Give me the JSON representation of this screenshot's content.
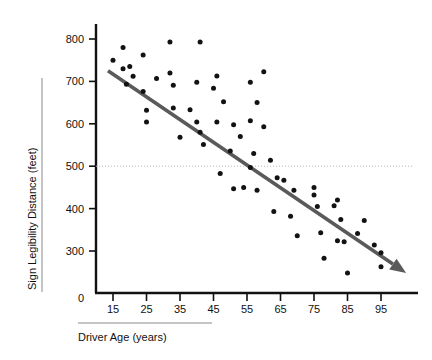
{
  "chart_data": {
    "type": "scatter",
    "title": "",
    "xlabel": "Driver Age (years)",
    "ylabel": "Sign Legibility Distance (feet)",
    "xlim": [
      10,
      102
    ],
    "ylim": [
      230,
      820
    ],
    "xticks": [
      "15",
      "25",
      "35",
      "45",
      "55",
      "65",
      "75",
      "85",
      "95"
    ],
    "xtick_values": [
      15,
      25,
      35,
      45,
      55,
      65,
      75,
      85,
      95
    ],
    "yticks": [
      "300",
      "400",
      "500",
      "600",
      "700",
      "800"
    ],
    "ytick_values": [
      300,
      400,
      500,
      600,
      700,
      800
    ],
    "origin_label": "0",
    "grid": false,
    "legend": null,
    "reference_line": {
      "name": "legibility-500-reference",
      "orientation": "horizontal",
      "y": 500,
      "style": "dotted",
      "color": "#b9b9b9"
    },
    "trend_line": {
      "name": "regression-trend-arrow",
      "type": "linear-fit",
      "color": "#5a5a5a",
      "x_start": 13.5,
      "y_start": 725,
      "x_end": 102.5,
      "y_end": 248,
      "arrow": true
    },
    "series": [
      {
        "name": "Driver sign legibility observations",
        "marker": "filled-circle",
        "color": "#121212",
        "points": [
          [
            15,
            750
          ],
          [
            18,
            780
          ],
          [
            18,
            730
          ],
          [
            19,
            693
          ],
          [
            20,
            735
          ],
          [
            21,
            712
          ],
          [
            24,
            762
          ],
          [
            24,
            676
          ],
          [
            25,
            632
          ],
          [
            25,
            604
          ],
          [
            28,
            707
          ],
          [
            32,
            793
          ],
          [
            32,
            720
          ],
          [
            33,
            691
          ],
          [
            33,
            637
          ],
          [
            35,
            568
          ],
          [
            38,
            633
          ],
          [
            40,
            698
          ],
          [
            40,
            604
          ],
          [
            41,
            793
          ],
          [
            41,
            580
          ],
          [
            42,
            551
          ],
          [
            45,
            684
          ],
          [
            46,
            713
          ],
          [
            46,
            604
          ],
          [
            47,
            483
          ],
          [
            48,
            652
          ],
          [
            50,
            536
          ],
          [
            51,
            598
          ],
          [
            51,
            447
          ],
          [
            53,
            570
          ],
          [
            54,
            450
          ],
          [
            56,
            607
          ],
          [
            56,
            698
          ],
          [
            56,
            497
          ],
          [
            57,
            530
          ],
          [
            58,
            650
          ],
          [
            58,
            443
          ],
          [
            60,
            593
          ],
          [
            60,
            723
          ],
          [
            62,
            514
          ],
          [
            63,
            393
          ],
          [
            64,
            473
          ],
          [
            66,
            467
          ],
          [
            68,
            382
          ],
          [
            69,
            443
          ],
          [
            70,
            336
          ],
          [
            75,
            450
          ],
          [
            75,
            432
          ],
          [
            76,
            405
          ],
          [
            77,
            343
          ],
          [
            78,
            283
          ],
          [
            81,
            407
          ],
          [
            82,
            420
          ],
          [
            82,
            324
          ],
          [
            83,
            374
          ],
          [
            84,
            322
          ],
          [
            85,
            248
          ],
          [
            88,
            341
          ],
          [
            90,
            372
          ],
          [
            93,
            314
          ],
          [
            95,
            296
          ],
          [
            95,
            263
          ]
        ]
      }
    ]
  },
  "axes": {
    "y_axis_name": "y-axis",
    "x_axis_name": "x-axis"
  }
}
